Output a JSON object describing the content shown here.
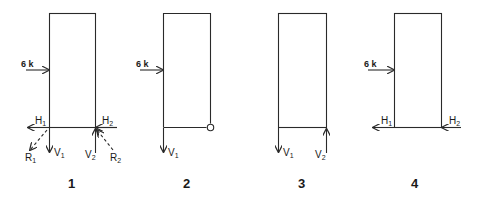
{
  "diagram": {
    "line_color": "#2a2a2a",
    "panels": [
      {
        "number": "1",
        "load_label": "6 k",
        "reactions": [
          {
            "name": "H",
            "sub": "1"
          },
          {
            "name": "H",
            "sub": "2"
          },
          {
            "name": "V",
            "sub": "1"
          },
          {
            "name": "V",
            "sub": "2"
          },
          {
            "name": "R",
            "sub": "1"
          },
          {
            "name": "R",
            "sub": "2"
          }
        ]
      },
      {
        "number": "2",
        "load_label": "6 k",
        "reactions": [
          {
            "name": "V",
            "sub": "1"
          }
        ],
        "pin_symbol": "circle"
      },
      {
        "number": "3",
        "reactions": [
          {
            "name": "V",
            "sub": "1"
          },
          {
            "name": "V",
            "sub": "2"
          }
        ]
      },
      {
        "number": "4",
        "load_label": "6 k",
        "reactions": [
          {
            "name": "H",
            "sub": "1"
          },
          {
            "name": "H",
            "sub": "2"
          }
        ]
      }
    ]
  }
}
